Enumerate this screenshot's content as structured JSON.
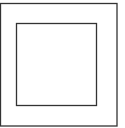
{
  "diagram": {
    "background": "#ffffff",
    "stroke_color": "#333333",
    "outer_square": {
      "x": 0.5,
      "y": 3.5,
      "width": 116.5,
      "height": 122.5,
      "stroke_width": 1.3
    },
    "inner_square": {
      "x": 16.5,
      "y": 23.5,
      "width": 80,
      "height": 82,
      "stroke_width": 1.3
    }
  }
}
